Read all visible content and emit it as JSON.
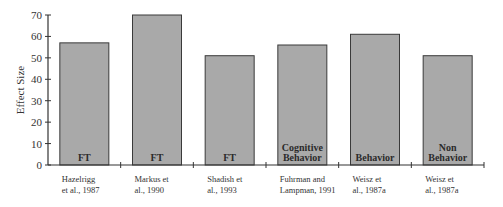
{
  "chart_data": {
    "type": "bar",
    "title": "",
    "xlabel": "",
    "ylabel": "Effect Size",
    "ylim": [
      0,
      70
    ],
    "yticks": [
      0,
      10,
      20,
      30,
      40,
      50,
      60,
      70
    ],
    "grid": false,
    "legend": null,
    "categories": [
      [
        "Hazelrigg",
        "et al., 1987"
      ],
      [
        "Markus et",
        "al., 1990"
      ],
      [
        "Shadish et",
        "al., 1993"
      ],
      [
        "Fuhrman and",
        "Lampman, 1991"
      ],
      [
        "Weisz et",
        "al., 1987a"
      ],
      [
        "Weisz et",
        "al., 1987a"
      ]
    ],
    "bar_labels": [
      [
        "FT"
      ],
      [
        "FT"
      ],
      [
        "FT"
      ],
      [
        "Cognitive",
        "Behavior"
      ],
      [
        "Behavior"
      ],
      [
        "Non",
        "Behavior"
      ]
    ],
    "values": [
      57,
      70,
      51,
      56,
      61,
      51
    ],
    "colors": {
      "bar_fill": "#a9a9a9",
      "bar_stroke": "#3a3a3a",
      "axis": "#333333"
    }
  }
}
